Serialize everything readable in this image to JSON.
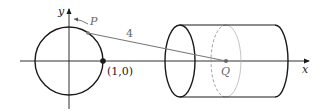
{
  "figure": {
    "labels": {
      "y_axis": "y",
      "x_axis": "x",
      "point_p": "P",
      "point_q": "Q",
      "point_on_axis": "(1,0)",
      "segment_length": "4"
    },
    "colors": {
      "stroke": "#1a1a1a",
      "segment": "#777777",
      "dashed": "#888888"
    }
  }
}
